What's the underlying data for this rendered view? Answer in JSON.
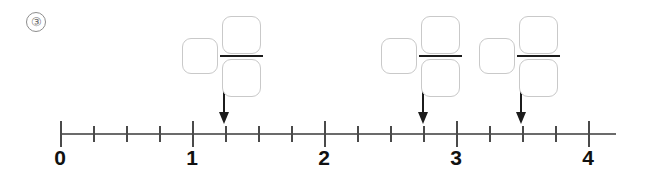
{
  "problem": {
    "number_label": "③",
    "instruction_visible": false
  },
  "number_line": {
    "origin_x": 60,
    "unit_px": 132,
    "axis_y": 133,
    "axis_start_x": 60,
    "axis_end_x": 616,
    "major_tick_values": [
      0,
      1,
      2,
      3,
      4
    ],
    "major_tick_labels": [
      "0",
      "1",
      "2",
      "3",
      "4"
    ],
    "minor_ticks_per_unit": 4,
    "minor_tick_values": [
      0.25,
      0.5,
      0.75,
      1.25,
      1.5,
      1.75,
      2.25,
      2.5,
      2.75,
      3.25,
      3.5,
      3.75
    ],
    "axis_color": "#6b6b6b",
    "tick_color": "#4a4a4a",
    "label_color": "#111111"
  },
  "arrows": [
    {
      "name": "arrow-1",
      "value": 1.25,
      "x": 224
    },
    {
      "name": "arrow-2",
      "value": 2.75,
      "x": 423
    },
    {
      "name": "arrow-3",
      "value": 3.5,
      "x": 521
    }
  ],
  "answer_groups": [
    {
      "name": "mixed-number-1",
      "x": 182,
      "whole": "",
      "numerator": "",
      "denominator": ""
    },
    {
      "name": "mixed-number-2",
      "x": 381,
      "whole": "",
      "numerator": "",
      "denominator": ""
    },
    {
      "name": "mixed-number-3",
      "x": 479,
      "whole": "",
      "numerator": "",
      "denominator": ""
    }
  ],
  "colors": {
    "box_border": "#c9c9c9",
    "fraction_bar": "#1c1c1c",
    "arrow": "#1c1c1c",
    "badge_border": "#8d8d8d",
    "background": "#ffffff"
  }
}
